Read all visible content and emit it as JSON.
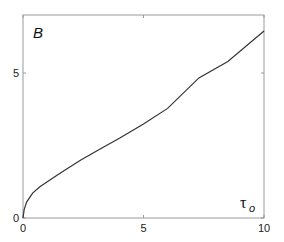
{
  "chart_data": {
    "type": "line",
    "title": "",
    "panel_label": "B",
    "xlabel": "τ",
    "xlabel_subscript": "o",
    "ylabel": "",
    "xlim": [
      0,
      10
    ],
    "ylim": [
      0,
      7
    ],
    "x_ticks": [
      0,
      5,
      10
    ],
    "x_tick_labels": [
      "0",
      "5",
      "10"
    ],
    "y_ticks": [
      0,
      5
    ],
    "y_tick_labels": [
      "0",
      "5"
    ],
    "grid": false,
    "legend": null,
    "series": [
      {
        "name": "B",
        "color": "#333333",
        "x": [
          0,
          0.05,
          0.15,
          0.4,
          0.7,
          1.1,
          1.6,
          2.4,
          3.2,
          4.0,
          5.0,
          6.0,
          7.3,
          8.5,
          10
        ],
        "y": [
          0,
          0.3,
          0.55,
          0.86,
          1.08,
          1.3,
          1.58,
          2.0,
          2.38,
          2.75,
          3.24,
          3.78,
          4.83,
          5.4,
          6.45
        ]
      }
    ]
  }
}
